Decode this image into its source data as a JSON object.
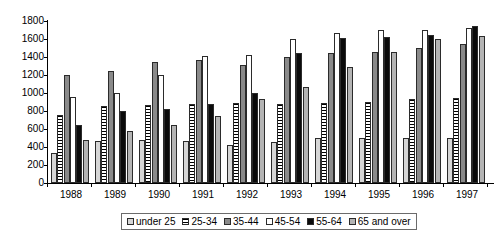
{
  "chart_data": {
    "type": "bar",
    "title": "",
    "subtitle": "",
    "xlabel": "",
    "ylabel": "",
    "categories": [
      "1988",
      "1989",
      "1990",
      "1991",
      "1992",
      "1993",
      "1994",
      "1995",
      "1996",
      "1997"
    ],
    "ylim": [
      0,
      1800
    ],
    "yticks": [
      0,
      200,
      400,
      600,
      800,
      1000,
      1200,
      1400,
      1600,
      1800
    ],
    "grid": false,
    "legend_position": "bottom",
    "series": [
      {
        "name": "under 25",
        "color": "#d6d6d6",
        "pattern": "solid-light-gray",
        "values": [
          330,
          470,
          480,
          470,
          420,
          460,
          500,
          500,
          500,
          500
        ]
      },
      {
        "name": "25-34",
        "color": "#ffffff",
        "pattern": "horizontal-stripes",
        "values": [
          760,
          860,
          870,
          880,
          890,
          880,
          890,
          900,
          930,
          950
        ]
      },
      {
        "name": "35-44",
        "color": "#8a8a8a",
        "pattern": "solid-dark-gray",
        "values": [
          1200,
          1250,
          1340,
          1370,
          1310,
          1400,
          1450,
          1460,
          1500,
          1540
        ]
      },
      {
        "name": "45-54",
        "color": "#ffffff",
        "pattern": "solid-white",
        "values": [
          960,
          1000,
          1200,
          1410,
          1420,
          1600,
          1670,
          1700,
          1700,
          1720
        ]
      },
      {
        "name": "55-64",
        "color": "#0b0b0b",
        "pattern": "solid-black",
        "values": [
          640,
          800,
          820,
          880,
          1000,
          1450,
          1610,
          1620,
          1650,
          1740
        ]
      },
      {
        "name": "65 and over",
        "color": "#b4b4b4",
        "pattern": "solid-medium-gray",
        "values": [
          480,
          580,
          650,
          750,
          930,
          1070,
          1290,
          1460,
          1600,
          1630
        ]
      }
    ]
  },
  "legend": {
    "items": [
      {
        "label": "under 25"
      },
      {
        "label": "25-34"
      },
      {
        "label": "35-44"
      },
      {
        "label": "45-54"
      },
      {
        "label": "55-64"
      },
      {
        "label": "65 and over"
      }
    ]
  }
}
